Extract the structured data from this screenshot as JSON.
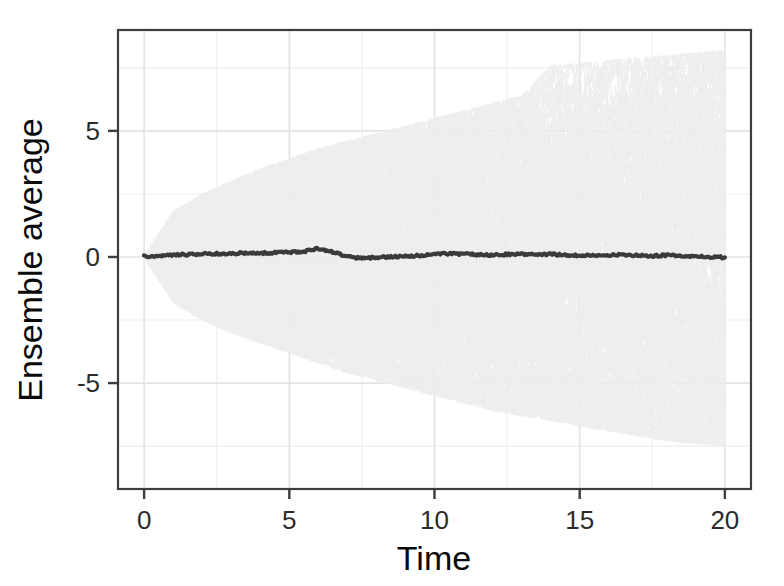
{
  "chart_data": {
    "type": "line",
    "title": "",
    "subtitle": "",
    "xlabel": "Time",
    "ylabel": "Ensemble average",
    "xlim": [
      -0.9,
      20.9
    ],
    "ylim": [
      -9.2,
      9.0
    ],
    "xticks": [
      0,
      5,
      10,
      15,
      20
    ],
    "xtick_labels": [
      "0",
      "5",
      "10",
      "15",
      "20"
    ],
    "yticks": [
      -5,
      0,
      5
    ],
    "ytick_labels": [
      "-5",
      "0",
      "5"
    ],
    "y_minor_ticks": [
      -7.5,
      -2.5,
      2.5,
      7.5
    ],
    "grid": true,
    "grid_major_color": "#e3e3e3",
    "grid_minor_color": "#eeeeee",
    "legend": "none",
    "background": "#ffffff",
    "panel_border_color": "#3d3d3d",
    "series": [
      {
        "name": "Ensemble trajectories (cloud)",
        "type": "spaghetti-band",
        "color": "#ededed",
        "opacity": 0.9,
        "description": "Dense overlay of many diffusive random-walk realizations; envelope widens as sqrt(time) from t=0",
        "envelope_t": [
          0,
          1,
          2,
          3,
          4,
          5,
          6,
          7,
          8,
          9,
          10,
          11,
          12,
          13,
          14,
          15,
          16,
          17,
          18,
          19,
          20
        ],
        "envelope_upper": [
          0.0,
          1.8,
          2.5,
          3.0,
          3.5,
          3.9,
          4.3,
          4.6,
          4.9,
          5.2,
          5.5,
          5.8,
          6.1,
          6.4,
          7.6,
          7.7,
          7.8,
          7.9,
          8.0,
          8.1,
          8.2
        ],
        "envelope_lower": [
          0.0,
          -1.8,
          -2.5,
          -3.0,
          -3.4,
          -3.8,
          -4.2,
          -4.6,
          -4.9,
          -5.2,
          -5.5,
          -5.8,
          -6.1,
          -6.3,
          -6.5,
          -6.7,
          -6.9,
          -7.1,
          -7.3,
          -7.4,
          -7.5
        ]
      },
      {
        "name": "Ensemble average",
        "type": "line",
        "color": "#3a3a3a",
        "width": 4.2,
        "t": [
          0,
          0.5,
          1,
          1.5,
          2,
          2.5,
          3,
          3.5,
          4,
          4.5,
          5,
          5.5,
          6,
          6.5,
          7,
          7.5,
          8,
          8.5,
          9,
          9.5,
          10,
          10.5,
          11,
          11.5,
          12,
          12.5,
          13,
          13.5,
          14,
          14.5,
          15,
          15.5,
          16,
          16.5,
          17,
          17.5,
          18,
          18.5,
          19,
          19.5,
          20
        ],
        "values": [
          0.02,
          0.05,
          0.08,
          0.1,
          0.12,
          0.13,
          0.14,
          0.16,
          0.15,
          0.17,
          0.19,
          0.22,
          0.34,
          0.2,
          0.02,
          -0.06,
          -0.02,
          0.01,
          0.03,
          0.06,
          0.1,
          0.13,
          0.12,
          0.09,
          0.07,
          0.1,
          0.12,
          0.09,
          0.11,
          0.08,
          0.06,
          0.05,
          0.07,
          0.09,
          0.06,
          0.04,
          0.07,
          0.05,
          0.02,
          0.0,
          -0.02
        ]
      }
    ]
  },
  "figure": {
    "x_axis_label": "Time",
    "y_axis_label": "Ensemble average"
  }
}
